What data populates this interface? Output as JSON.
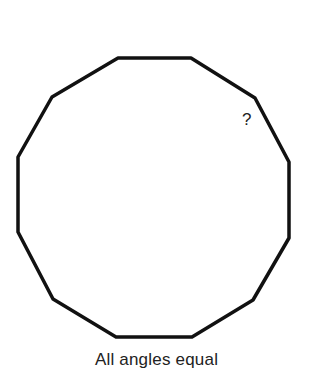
{
  "diagram": {
    "shape": "regular dodecagon",
    "stroke_color": "#111111",
    "vertices": [
      [
        118,
        58
      ],
      [
        191,
        58
      ],
      [
        255,
        98
      ],
      [
        289,
        162
      ],
      [
        289,
        238
      ],
      [
        253,
        300
      ],
      [
        192,
        337
      ],
      [
        116,
        337
      ],
      [
        53,
        299
      ],
      [
        18,
        232
      ],
      [
        18,
        157
      ],
      [
        52,
        97
      ]
    ],
    "unknown_label": "?",
    "caption": "All angles equal"
  }
}
